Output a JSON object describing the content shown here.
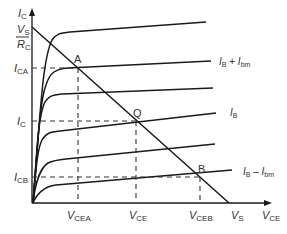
{
  "diagram": {
    "axes": {
      "y_label": {
        "main": "I",
        "sub": "C"
      },
      "x_label": {
        "main": "V",
        "sub": "CE"
      }
    },
    "y_ticks": [
      {
        "id": "vs_over_rc",
        "num_main": "V",
        "num_sub": "S",
        "den_main": "R",
        "den_sub": "C"
      },
      {
        "id": "ica",
        "main": "I",
        "sub": "CA"
      },
      {
        "id": "ic",
        "main": "I",
        "sub": "C"
      },
      {
        "id": "icb",
        "main": "I",
        "sub": "CB"
      }
    ],
    "x_ticks": [
      {
        "id": "vcea",
        "main": "V",
        "sub": "CEA"
      },
      {
        "id": "vce",
        "main": "V",
        "sub": "CE"
      },
      {
        "id": "vceb",
        "main": "V",
        "sub": "CEB"
      },
      {
        "id": "vs",
        "main": "V",
        "sub": "S"
      }
    ],
    "points": [
      {
        "id": "A",
        "label": "A"
      },
      {
        "id": "Q",
        "label": "Q"
      },
      {
        "id": "B",
        "label": "B"
      }
    ],
    "curve_labels": [
      {
        "id": "ib_plus",
        "a_main": "I",
        "a_sub": "B",
        "op": " + ",
        "b_main": "I",
        "b_sub": "bm"
      },
      {
        "id": "ib",
        "a_main": "I",
        "a_sub": "B"
      },
      {
        "id": "ib_minus",
        "a_main": "I",
        "a_sub": "B",
        "op": " – ",
        "b_main": "I",
        "b_sub": "bm"
      }
    ],
    "colors": {
      "line": "#1a1a1a",
      "text": "#333333",
      "background": "#ffffff"
    }
  }
}
